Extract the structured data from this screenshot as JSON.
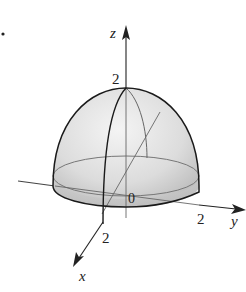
{
  "figure": {
    "marker": ".",
    "axes": {
      "z": {
        "label": "z",
        "tick": "2"
      },
      "y": {
        "label": "y",
        "tick": "2"
      },
      "x": {
        "label": "x",
        "tick": "2"
      },
      "origin": "0"
    },
    "colors": {
      "fill_light": "#eeeeee",
      "fill_dark": "#bdbdbd",
      "outline": "#1a1a1a",
      "axis": "#333333"
    }
  }
}
